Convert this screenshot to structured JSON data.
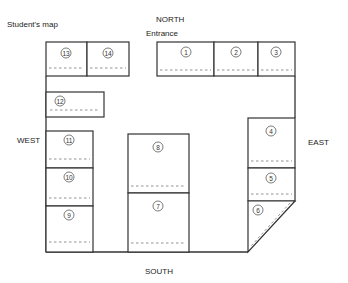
{
  "title": "Student's map",
  "directions": {
    "north": "NORTH",
    "south": "SOUTH",
    "east": "EAST",
    "west": "WEST"
  },
  "entrance_label": "Entrance",
  "stalls": [
    {
      "id": "1",
      "label": "1"
    },
    {
      "id": "2",
      "label": "2"
    },
    {
      "id": "3",
      "label": "3"
    },
    {
      "id": "4",
      "label": "4"
    },
    {
      "id": "5",
      "label": "5"
    },
    {
      "id": "6",
      "label": "6"
    },
    {
      "id": "7",
      "label": "7"
    },
    {
      "id": "8",
      "label": "8"
    },
    {
      "id": "9",
      "label": "9"
    },
    {
      "id": "10",
      "label": "10"
    },
    {
      "id": "11",
      "label": "11"
    },
    {
      "id": "12",
      "label": "12"
    },
    {
      "id": "13",
      "label": "13"
    },
    {
      "id": "14",
      "label": "14"
    }
  ]
}
